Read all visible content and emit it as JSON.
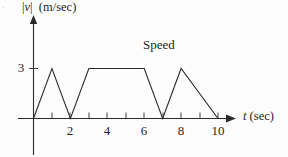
{
  "figure": {
    "corner_mark": "·",
    "y_axis_title": "|v|  (m/sec)",
    "y_axis_title_var": "v",
    "x_axis_title": "t (sec)",
    "x_axis_title_var": "t",
    "x_axis_title_unit": " (sec)",
    "series_label": "Speed",
    "y_tick_labels": [
      "3"
    ],
    "x_tick_labels": [
      "2",
      "4",
      "6",
      "8",
      "10"
    ],
    "line_color": "#2b2b2b",
    "background_color": "#fdfdfd"
  },
  "chart_data": {
    "type": "line",
    "title": "",
    "series": [
      {
        "name": "Speed",
        "x": [
          0,
          1,
          2,
          3,
          6,
          7,
          8,
          10
        ],
        "y": [
          0,
          3,
          0,
          3,
          3,
          0,
          3,
          0
        ]
      }
    ],
    "xlabel": "t (sec)",
    "ylabel": "|v| (m/sec)",
    "xlim": [
      0,
      10
    ],
    "ylim": [
      0,
      4
    ],
    "xticks": [
      1,
      2,
      3,
      4,
      5,
      6,
      7,
      8,
      9,
      10
    ],
    "xtick_labels": [
      "",
      "2",
      "",
      "4",
      "",
      "6",
      "",
      "8",
      "",
      "10"
    ],
    "yticks": [
      3
    ],
    "ytick_labels": [
      "3"
    ],
    "grid": false,
    "legend": "none",
    "annotations": [
      {
        "text": "Speed",
        "x": 5.0,
        "y": 3.75
      }
    ]
  }
}
